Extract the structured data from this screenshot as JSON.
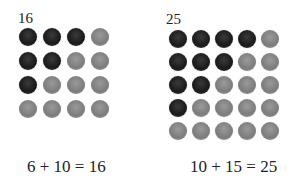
{
  "figures": [
    {
      "label": "16",
      "equation": "6 + 10 = 16",
      "size": 4,
      "pattern": [
        [
          "dark",
          "dark",
          "dark",
          "light"
        ],
        [
          "dark",
          "dark",
          "light",
          "light"
        ],
        [
          "dark",
          "light",
          "light",
          "light"
        ],
        [
          "light",
          "light",
          "light",
          "light"
        ]
      ]
    },
    {
      "label": "25",
      "equation": "10 + 15 = 25",
      "size": 5,
      "pattern": [
        [
          "dark",
          "dark",
          "dark",
          "dark",
          "light"
        ],
        [
          "dark",
          "dark",
          "dark",
          "light",
          "light"
        ],
        [
          "dark",
          "dark",
          "light",
          "light",
          "light"
        ],
        [
          "dark",
          "light",
          "light",
          "light",
          "light"
        ],
        [
          "light",
          "light",
          "light",
          "light",
          "light"
        ]
      ]
    }
  ],
  "colors": {
    "dark": "#1f1f1f",
    "light": "#858585"
  }
}
